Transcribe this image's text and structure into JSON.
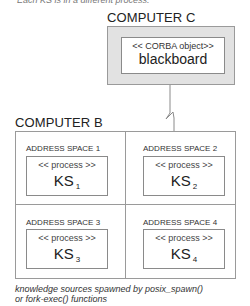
{
  "caption_top": "Each KS is in a different process.",
  "computer_c": {
    "label": "COMPUTER C",
    "object": {
      "stereotype": "<< CORBA object>>",
      "name": "blackboard"
    }
  },
  "computer_b": {
    "label": "COMPUTER B",
    "address_spaces": [
      {
        "label": "ADDRESS SPACE 1",
        "stereotype": "<< process >>",
        "ks": "KS",
        "sub": "1"
      },
      {
        "label": "ADDRESS SPACE 2",
        "stereotype": "<< process >>",
        "ks": "KS",
        "sub": "2"
      },
      {
        "label": "ADDRESS SPACE 3",
        "stereotype": "<< process >>",
        "ks": "KS",
        "sub": "3"
      },
      {
        "label": "ADDRESS SPACE 4",
        "stereotype": "<< process >>",
        "ks": "KS",
        "sub": "4"
      }
    ]
  },
  "caption_bottom": {
    "line1": "knowledge sources spawned by posix_spawn()",
    "line2": "or fork-exec() functions"
  },
  "colors": {
    "computer_c_fill": "#e2e2e2",
    "border": "#9a9a9a"
  }
}
